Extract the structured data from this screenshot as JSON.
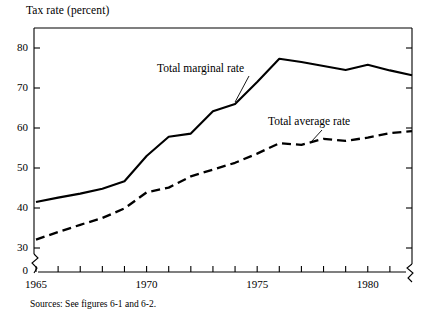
{
  "figure": {
    "ylabel": "Tax rate (percent)",
    "source_note": "Sources: See figures 6-1 and 6-2."
  },
  "annotations": {
    "marginal_label": "Total marginal rate",
    "average_label": "Total average rate"
  },
  "axis": {
    "y_ticks": [
      "80",
      "70",
      "60",
      "50",
      "40",
      "30",
      "0"
    ],
    "x_ticks": [
      "1965",
      "1970",
      "1975",
      "1980"
    ]
  },
  "chart_data": {
    "type": "line",
    "title": "",
    "xlabel": "",
    "ylabel": "Tax rate (percent)",
    "xlim": [
      1965,
      1982
    ],
    "ylim": [
      30,
      82
    ],
    "y_axis_break": true,
    "y_break_from": 0,
    "y_break_to": 30,
    "grid": false,
    "legend": "inline-annotations",
    "y_tick_values": [
      80,
      70,
      60,
      50,
      40,
      30,
      0
    ],
    "x_tick_values": [
      1965,
      1970,
      1975,
      1980
    ],
    "x_minor_tick_interval": 1,
    "x": [
      1965,
      1966,
      1967,
      1968,
      1969,
      1970,
      1971,
      1972,
      1973,
      1974,
      1975,
      1976,
      1977,
      1978,
      1979,
      1980,
      1981,
      1982
    ],
    "series": [
      {
        "name": "Total marginal rate",
        "style": "solid",
        "values": [
          41.5,
          42.6,
          43.6,
          44.8,
          46.7,
          53.0,
          57.8,
          58.6,
          64.2,
          66.0,
          71.5,
          77.3,
          76.5,
          75.5,
          74.5,
          75.8,
          74.4,
          73.2
        ]
      },
      {
        "name": "Total average rate",
        "style": "dashed",
        "values": [
          32.1,
          34.0,
          35.8,
          37.5,
          39.9,
          43.9,
          45.1,
          47.9,
          49.6,
          51.3,
          53.6,
          56.2,
          55.8,
          57.3,
          56.8,
          57.6,
          58.7,
          59.2
        ]
      }
    ],
    "annotations": [
      {
        "text": "Total marginal rate",
        "points_to_series": "Total marginal rate",
        "points_to_x": 1974
      },
      {
        "text": "Total average rate",
        "points_to_series": "Total average rate",
        "points_to_x": 1977.4
      }
    ]
  }
}
